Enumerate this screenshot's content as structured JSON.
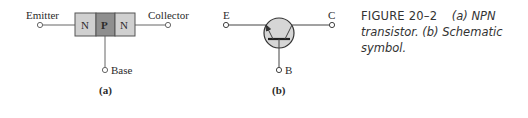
{
  "figure": {
    "number": "FIGURE 20–2",
    "caption_part_a": "(a) NPN transistor.",
    "caption_part_b": "(b) Schematic symbol."
  },
  "panel_a": {
    "label": "(a)",
    "regions": [
      "N",
      "P",
      "N"
    ],
    "terminals": {
      "emitter": "Emitter",
      "collector": "Collector",
      "base": "Base"
    },
    "colors": {
      "n_region": "#d0d0d0",
      "p_region": "#8f8f8f",
      "outline": "#555555"
    }
  },
  "panel_b": {
    "label": "(b)",
    "terminals": {
      "emitter": "E",
      "collector": "C",
      "base": "B"
    },
    "colors": {
      "circle_fill": "#d6d6d6",
      "outline": "#333333"
    }
  }
}
